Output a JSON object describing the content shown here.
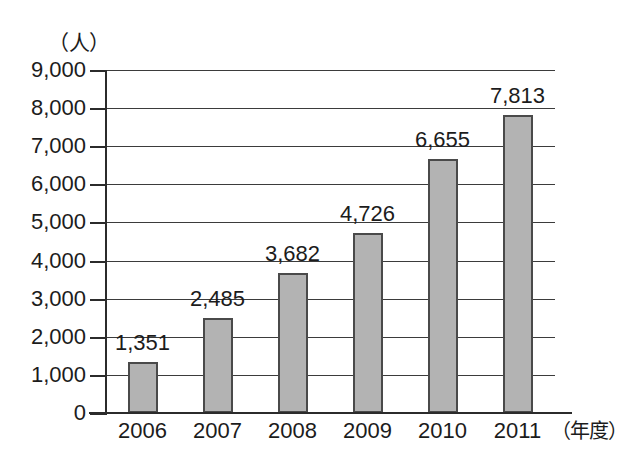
{
  "chart_data": {
    "type": "bar",
    "title": "",
    "subtitle": "",
    "xlabel": "（年度）",
    "ylabel": "（人）",
    "categories": [
      "2006",
      "2007",
      "2008",
      "2009",
      "2010",
      "2011"
    ],
    "values": [
      1351,
      2485,
      3682,
      4726,
      6655,
      7813
    ],
    "value_labels": [
      "1,351",
      "2,485",
      "3,682",
      "4,726",
      "6,655",
      "7,813"
    ],
    "ylim": [
      0,
      9000
    ],
    "ytick_values": [
      0,
      1000,
      2000,
      3000,
      4000,
      5000,
      6000,
      7000,
      8000,
      9000
    ],
    "ytick_labels": [
      "0",
      "1,000",
      "2,000",
      "3,000",
      "4,000",
      "5,000",
      "6,000",
      "7,000",
      "8,000",
      "9,000"
    ],
    "grid": true,
    "legend": null,
    "bar_color": "#b3b3b3",
    "bar_border_color": "#4a4a4a",
    "axis_color": "#2b2b2b",
    "grid_color": "#3b3b3b",
    "background_color": "#ffffff",
    "text_color": "#1c1c1c"
  }
}
